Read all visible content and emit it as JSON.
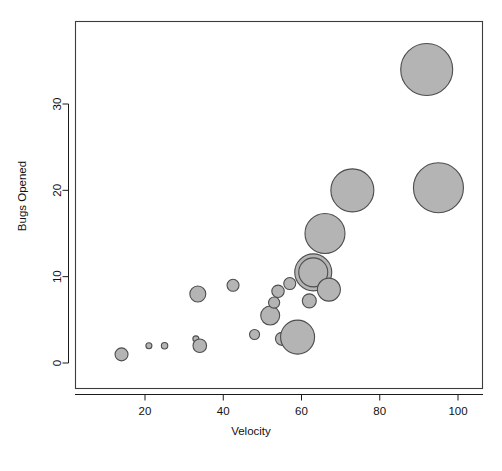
{
  "chart_data": {
    "type": "scatter",
    "title": "",
    "xlabel": "Velocity",
    "ylabel": "Bugs Opened",
    "xlim": [
      8,
      110
    ],
    "ylim": [
      -3,
      38
    ],
    "xticks": [
      20,
      40,
      60,
      80,
      100
    ],
    "xticklabels": [
      "20",
      "40",
      "60",
      "80",
      "100"
    ],
    "yticks": [
      0,
      10,
      20,
      30
    ],
    "yticklabels": [
      "0",
      "10",
      "20",
      "30"
    ],
    "grid": false,
    "legend": null,
    "bubble_fill": "#b4b4b4",
    "bubble_stroke": "#4d4d4d",
    "size_encoding": "radius proportional to a third variable (team/effort size)",
    "points": [
      {
        "x": 14,
        "y": 1,
        "r": 6.5
      },
      {
        "x": 21,
        "y": 2,
        "r": 3.0
      },
      {
        "x": 25,
        "y": 2,
        "r": 3.2
      },
      {
        "x": 33,
        "y": 2.8,
        "r": 3.0
      },
      {
        "x": 34,
        "y": 2,
        "r": 6.8
      },
      {
        "x": 33.5,
        "y": 8,
        "r": 8.0
      },
      {
        "x": 42.5,
        "y": 9,
        "r": 6.0
      },
      {
        "x": 48,
        "y": 3.3,
        "r": 5.0
      },
      {
        "x": 52,
        "y": 5.5,
        "r": 9.5
      },
      {
        "x": 53,
        "y": 7,
        "r": 5.6
      },
      {
        "x": 54,
        "y": 8.3,
        "r": 6.2
      },
      {
        "x": 55,
        "y": 2.8,
        "r": 6.5
      },
      {
        "x": 57,
        "y": 9.2,
        "r": 6.0
      },
      {
        "x": 59,
        "y": 3,
        "r": 17.0
      },
      {
        "x": 63,
        "y": 10.5,
        "r": 18.5
      },
      {
        "x": 63,
        "y": 10.5,
        "r": 14.5
      },
      {
        "x": 62,
        "y": 7.2,
        "r": 7.0
      },
      {
        "x": 67,
        "y": 8.5,
        "r": 11.5
      },
      {
        "x": 66,
        "y": 15,
        "r": 20.0
      },
      {
        "x": 73,
        "y": 20,
        "r": 21.5
      },
      {
        "x": 92,
        "y": 34,
        "r": 26.0
      },
      {
        "x": 95,
        "y": 20.3,
        "r": 25.0
      }
    ]
  },
  "geometry": {
    "plot_left": 75,
    "plot_right": 483,
    "plot_top": 21,
    "plot_bottom": 389,
    "x_pix_20": 145,
    "x_pix_100": 458,
    "y_pix_0": 363,
    "y_pix_30": 104
  }
}
